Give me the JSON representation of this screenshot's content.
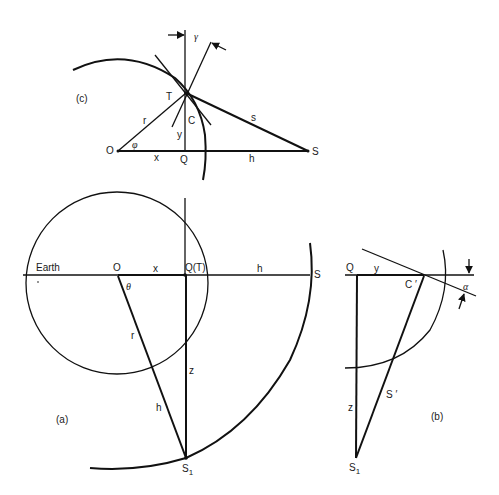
{
  "figure_c": {
    "panel_label": "(c)",
    "points": {
      "O": "O",
      "Q": "Q",
      "S": "S",
      "T": "T"
    },
    "segments": {
      "r": "r",
      "x": "x",
      "h": "h",
      "s": "s",
      "y": "y",
      "C": "C"
    },
    "angles": {
      "phi": "φ",
      "gamma": "γ"
    }
  },
  "figure_a": {
    "panel_label": "(a)",
    "earth_label": "Earth",
    "points": {
      "O": "O",
      "QT": "Q(T)",
      "S": "S",
      "S1": "S",
      "S1_sub": "1"
    },
    "segments": {
      "x": "x",
      "h_top": "h",
      "r": "r",
      "z": "z",
      "h_diag": "h"
    },
    "angles": {
      "theta": "θ"
    }
  },
  "figure_b": {
    "panel_label": "(b)",
    "points": {
      "Q": "Q",
      "Cprime": "C ′",
      "S1": "S",
      "S1_sub": "1"
    },
    "segments": {
      "y": "y",
      "z": "z",
      "Sprime": "S ′"
    },
    "angles": {
      "alpha": "α"
    }
  }
}
